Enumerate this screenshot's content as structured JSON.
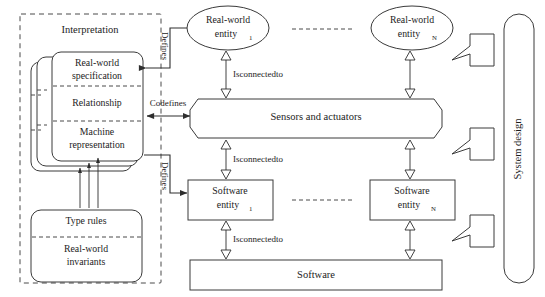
{
  "diagram": {
    "colors": {
      "stroke": "#3a3a3a",
      "text": "#1c1c1c",
      "background": "#ffffff",
      "dashed": "#4a4a4a"
    }
  },
  "interpretation": {
    "label": "Interpretation",
    "stacked_card": {
      "layers": 3,
      "sections": [
        {
          "label": "Real-world specification",
          "line1": "Real-world",
          "line2": "specification"
        },
        {
          "label": "Relationship",
          "line1": "Relationship",
          "line2": ""
        },
        {
          "label": "Machine representation",
          "line1": "Machine",
          "line2": "representation"
        }
      ]
    },
    "rules_card": {
      "sections": [
        {
          "label": "Type rules",
          "line1": "Type rules",
          "line2": ""
        },
        {
          "label": "Real-world invariants",
          "line1": "Real-world",
          "line2": "invariants"
        }
      ]
    }
  },
  "relations": {
    "defines_top": "Defines",
    "codefines": "Codefines",
    "defines_bottom": "Defines",
    "isconnectedto_1": "Isconnectedto",
    "isconnectedto_2": "Isconnectedto",
    "isconnectedto_3": "Isconnectedto"
  },
  "entities": {
    "real_world": [
      {
        "line1": "Real-world",
        "line2": "entity",
        "subscript": "1"
      },
      {
        "line1": "Real-world",
        "line2": "entity",
        "subscript": "N"
      }
    ],
    "software": [
      {
        "line1": "Software",
        "line2": "entity",
        "subscript": "1"
      },
      {
        "line1": "Software",
        "line2": "entity",
        "subscript": "N"
      }
    ]
  },
  "layers": {
    "sensors": "Sensors and actuators",
    "software": "Software"
  },
  "system_design": {
    "label": "System design",
    "arrow_count": 3
  }
}
